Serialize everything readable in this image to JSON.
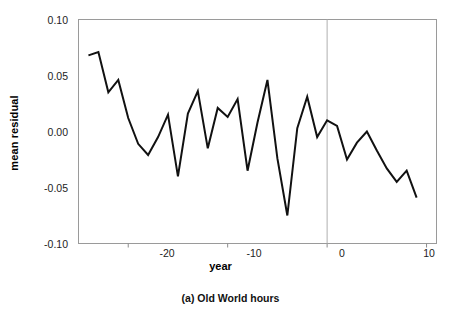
{
  "chart_data": {
    "type": "line",
    "title": "",
    "caption": "(a) Old World hours",
    "xlabel": "year",
    "ylabel": "mean residual",
    "xlim": [
      -25,
      11
    ],
    "ylim": [
      -0.1,
      0.1
    ],
    "xticks": [
      -20,
      -10,
      0,
      10
    ],
    "xtick_labels": [
      "-20",
      "-10",
      "0",
      "10"
    ],
    "yticks": [
      0.1,
      0.05,
      0.0,
      -0.05,
      -0.1
    ],
    "ytick_labels": [
      "0.10",
      "0.05",
      "0.00",
      "-0.05",
      "-0.10"
    ],
    "grid": false,
    "legend": null,
    "annotations": [
      {
        "type": "vertical-line",
        "x": 0,
        "color": "#b0b0b0",
        "label": "year-zero-reference-line"
      }
    ],
    "series": [
      {
        "name": "mean residual",
        "color": "#111111",
        "line_width": 2,
        "x": [
          -24,
          -23,
          -22,
          -21,
          -20,
          -19,
          -18,
          -17,
          -16,
          -15,
          -14,
          -13,
          -12,
          -11,
          -10,
          -9,
          -8,
          -7,
          -6,
          -5,
          -4,
          -3,
          -2,
          -1,
          0,
          1,
          2,
          3,
          4,
          5,
          6,
          7,
          8,
          9
        ],
        "y": [
          0.068,
          0.071,
          0.035,
          0.046,
          0.012,
          -0.011,
          -0.021,
          -0.005,
          0.015,
          -0.04,
          0.016,
          0.036,
          -0.015,
          0.021,
          0.013,
          0.029,
          -0.035,
          0.008,
          0.046,
          -0.024,
          -0.075,
          0.003,
          0.031,
          -0.005,
          0.01,
          0.005,
          -0.025,
          -0.01,
          0.0,
          -0.017,
          -0.033,
          -0.045,
          -0.035,
          -0.059
        ]
      }
    ]
  },
  "axes": {
    "frame_color": "#8c8c8c",
    "tick_color": "#8c8c8c",
    "background": "#ffffff"
  }
}
